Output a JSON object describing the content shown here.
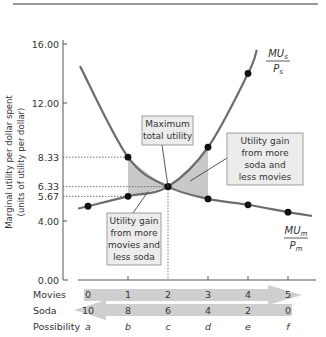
{
  "chart_data": {
    "type": "line",
    "title": "",
    "ylabel": "Marginal utility per dollar spent",
    "ylabel_sub": "(units of utility per dollar)",
    "ylim": [
      0,
      16
    ],
    "yticks": [
      "0.00",
      "4.00",
      "5.67",
      "6.33",
      "8.33",
      "12.00",
      "16.00"
    ],
    "x": [
      0,
      1,
      2,
      3,
      4,
      5
    ],
    "rows": {
      "movies": {
        "label": "Movies",
        "values": [
          "0",
          "1",
          "2",
          "3",
          "4",
          "5"
        ]
      },
      "soda": {
        "label": "Soda",
        "values": [
          "10",
          "8",
          "6",
          "4",
          "2",
          "0"
        ]
      },
      "possibility": {
        "label": "Possibility",
        "values": [
          "a",
          "b",
          "c",
          "d",
          "e",
          "f"
        ]
      }
    },
    "series": [
      {
        "name": "MU_m/P_m",
        "label_top": "MU",
        "label_sub": "m",
        "label_bottom": "P",
        "label_bottom_sub": "m",
        "curve_start": {
          "x": -0.2,
          "y": 14.5
        },
        "points": [
          {
            "x": 1,
            "y": 8.33
          },
          {
            "x": 2,
            "y": 6.33
          },
          {
            "x": 3,
            "y": 5.5
          },
          {
            "x": 4,
            "y": 5.1
          },
          {
            "x": 5,
            "y": 4.6
          }
        ]
      },
      {
        "name": "MU_s/P_s",
        "label_top": "MU",
        "label_sub": "s",
        "label_bottom": "P",
        "label_bottom_sub": "s",
        "curve_end": {
          "x": 4.22,
          "y": 15.6
        },
        "points": [
          {
            "x": 0,
            "y": 5.0
          },
          {
            "x": 1,
            "y": 5.67
          },
          {
            "x": 2,
            "y": 6.33
          },
          {
            "x": 3,
            "y": 9.0
          },
          {
            "x": 4,
            "y": 14.0
          }
        ]
      }
    ],
    "annotations": [
      {
        "id": "max",
        "lines": [
          "Maximum",
          "total utility"
        ]
      },
      {
        "id": "left",
        "lines": [
          "Utility gain",
          "from more",
          "movies and",
          "less soda"
        ]
      },
      {
        "id": "right",
        "lines": [
          "Utility gain",
          "from more",
          "soda and",
          "less movies"
        ]
      }
    ],
    "colors": {
      "curve": "#6d6d6d",
      "point": "#111111",
      "shade": "#c9c9c9",
      "box_fill": "#ececec",
      "box_stroke": "#8a8a8a",
      "arrow": "#cfcfcf",
      "text": "#333333"
    }
  }
}
